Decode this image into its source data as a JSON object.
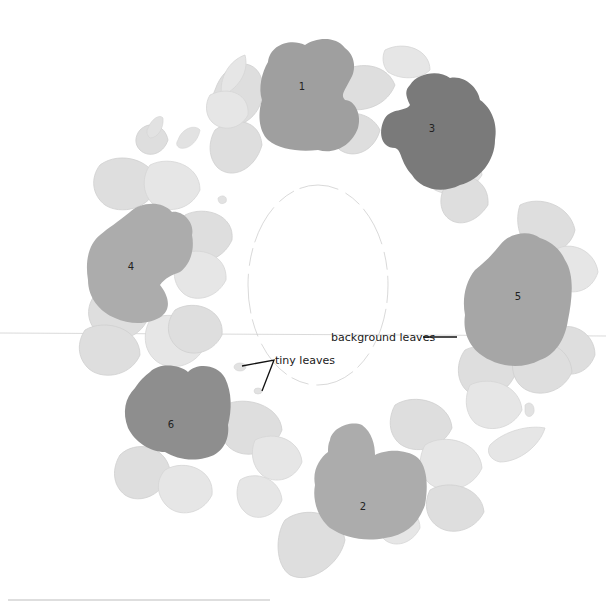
{
  "diagram": {
    "title": "",
    "colors": {
      "background": "#ffffff",
      "leaf": "#dedede",
      "flower_light": "#a9a9a9",
      "flower_mid": "#9e9e9e",
      "flower_dark": "#7c7c7c",
      "text": "#222222"
    },
    "flowers": [
      {
        "id": "1",
        "label": "1",
        "shade": "#9f9f9f"
      },
      {
        "id": "2",
        "label": "2",
        "shade": "#acacac"
      },
      {
        "id": "3",
        "label": "3",
        "shade": "#7a7a7a"
      },
      {
        "id": "4",
        "label": "4",
        "shade": "#acacac"
      },
      {
        "id": "5",
        "label": "5",
        "shade": "#a6a6a6"
      },
      {
        "id": "6",
        "label": "6",
        "shade": "#8e8e8e"
      }
    ],
    "annotations": {
      "background_leaves": "background leaves",
      "tiny_leaves": "tiny leaves"
    }
  }
}
